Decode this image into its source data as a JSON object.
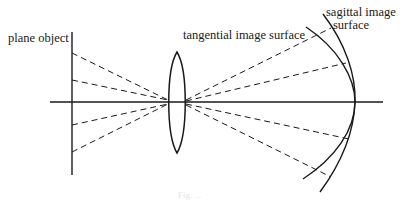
{
  "diagram": {
    "type": "optics-ray-diagram",
    "labels": {
      "object": "plane object",
      "tangential": "tangential image surface",
      "sagittal_line1": "sagittal image",
      "sagittal_line2": "surface"
    },
    "caption": "Fig. ...",
    "elements": [
      {
        "name": "plane-object",
        "type": "vertical-line"
      },
      {
        "name": "optical-axis",
        "type": "horizontal-line"
      },
      {
        "name": "lens",
        "type": "biconvex-lens"
      },
      {
        "name": "tangential-image-surface",
        "type": "curve"
      },
      {
        "name": "sagittal-image-surface",
        "type": "curve"
      },
      {
        "name": "rays",
        "type": "dashed-lines",
        "count": 8
      }
    ],
    "colors": {
      "line": "#1a1a1a",
      "background": "#ffffff"
    }
  }
}
